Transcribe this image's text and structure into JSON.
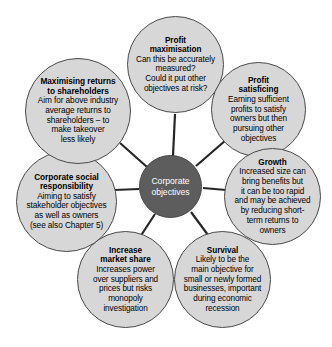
{
  "diagram": {
    "type": "hub-and-spoke",
    "hub": {
      "label": "Corporate\nobjectives",
      "fill_color": "#5d5d5d",
      "text_color": "#ffffff"
    },
    "node_fill_color": "#d7d7d7",
    "node_border_color": "#4a4a4a",
    "spoke_color": "#262626",
    "background_color": "#ffffff",
    "nodes": [
      {
        "id": "profit-maximisation",
        "title": "Profit\nmaximisation",
        "body": "Can this be accurately\nmeasured?\nCould it put other\nobjectives at risk?"
      },
      {
        "id": "profit-satisficing",
        "title": "Profit\nsatisficing",
        "body": "Earning sufficient\nprofits to satisfy\nowners but then\npursuing other\nobjectives"
      },
      {
        "id": "growth",
        "title": "Growth",
        "body": "Increased size can\nbring benefits but\nit can be too rapid\nand may be achieved\nby reducing short-\nterm returns to\nowners"
      },
      {
        "id": "survival",
        "title": "Survival",
        "body": "Likely to be the\nmain objective for\nsmall or newly formed\nbusinesses, important\nduring economic\nrecession"
      },
      {
        "id": "increase-market-share",
        "title": "Increase\nmarket share",
        "body": "Increases power\nover suppliers and\nprices but risks\nmonopoly\ninvestigation"
      },
      {
        "id": "corporate-social-responsibility",
        "title": "Corporate social\nresponsibility",
        "body": "Aiming to satisfy\nstakeholder objectives\nas well as owners\n(see also Chapter 5)"
      },
      {
        "id": "maximising-returns-to-shareholders",
        "title": "Maximising returns\nto shareholders",
        "body": "Aim for above industry\naverage returns to\nshareholders – to\nmake takeover\nless likely"
      }
    ]
  }
}
